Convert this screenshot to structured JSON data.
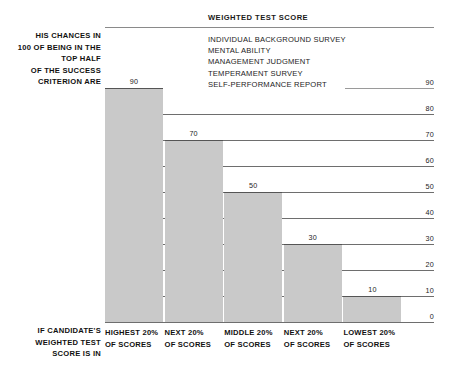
{
  "chart_data": {
    "type": "bar",
    "title": "WEIGHTED TEST SCORE",
    "xlabel": "",
    "ylabel": "",
    "ylim": [
      0,
      100
    ],
    "grid": true,
    "legend_position": "top-right-inside",
    "categories": [
      "HIGHEST 20%",
      "NEXT 20%",
      "MIDDLE 20%",
      "NEXT 20%",
      "LOWEST 20%"
    ],
    "category_sublabel": "OF SCORES",
    "values": [
      90,
      70,
      50,
      30,
      10
    ],
    "value_labels": [
      "90",
      "70",
      "50",
      "30",
      "10"
    ],
    "yticks": [
      90,
      80,
      70,
      60,
      50,
      40,
      30,
      20,
      10,
      0
    ],
    "ytick_labels": [
      "90",
      "80",
      "70",
      "60",
      "50",
      "40",
      "30",
      "20",
      "10",
      "0"
    ],
    "legend_entries": [
      "INDIVIDUAL BACKGROUND SURVEY",
      "MENTAL ABILITY",
      "MANAGEMENT JUDGMENT",
      "TEMPERAMENT SURVEY",
      "SELF-PERFORMANCE REPORT"
    ],
    "bar_color": "#c9c9c9",
    "gridline_color": "#6e6e6e"
  },
  "axis_caption_left_top": [
    "HIS CHANCES IN",
    "100 OF BEING IN THE",
    "TOP HALF",
    "OF THE SUCCESS",
    "CRITERION ARE"
  ],
  "axis_caption_left_bottom": [
    "IF CANDIDATE'S",
    "WEIGHTED TEST",
    "SCORE IS IN"
  ]
}
